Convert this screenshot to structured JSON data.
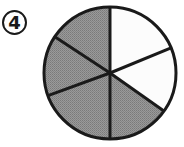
{
  "label": {
    "text": "4"
  },
  "figure": {
    "type": "fraction-circle",
    "total_parts": 6,
    "shaded_parts": 4,
    "unshaded_parts": 2,
    "center": [
      110,
      73
    ],
    "radius": 66,
    "spoke_endpoints": [
      [
        110,
        7
      ],
      [
        166,
        50
      ],
      [
        161,
        109
      ],
      [
        110,
        139
      ],
      [
        47,
        96
      ],
      [
        55,
        37
      ]
    ],
    "sectors": [
      {
        "from": 0,
        "to": 1,
        "shaded": false
      },
      {
        "from": 1,
        "to": 2,
        "shaded": false
      },
      {
        "from": 2,
        "to": 3,
        "shaded": true
      },
      {
        "from": 3,
        "to": 4,
        "shaded": true
      },
      {
        "from": 4,
        "to": 5,
        "shaded": true
      },
      {
        "from": 5,
        "to": 0,
        "shaded": true
      }
    ],
    "colors": {
      "shaded": "#8e8e8e",
      "unshaded": "#fcfcfc",
      "stroke": "#1a1a1a"
    }
  }
}
